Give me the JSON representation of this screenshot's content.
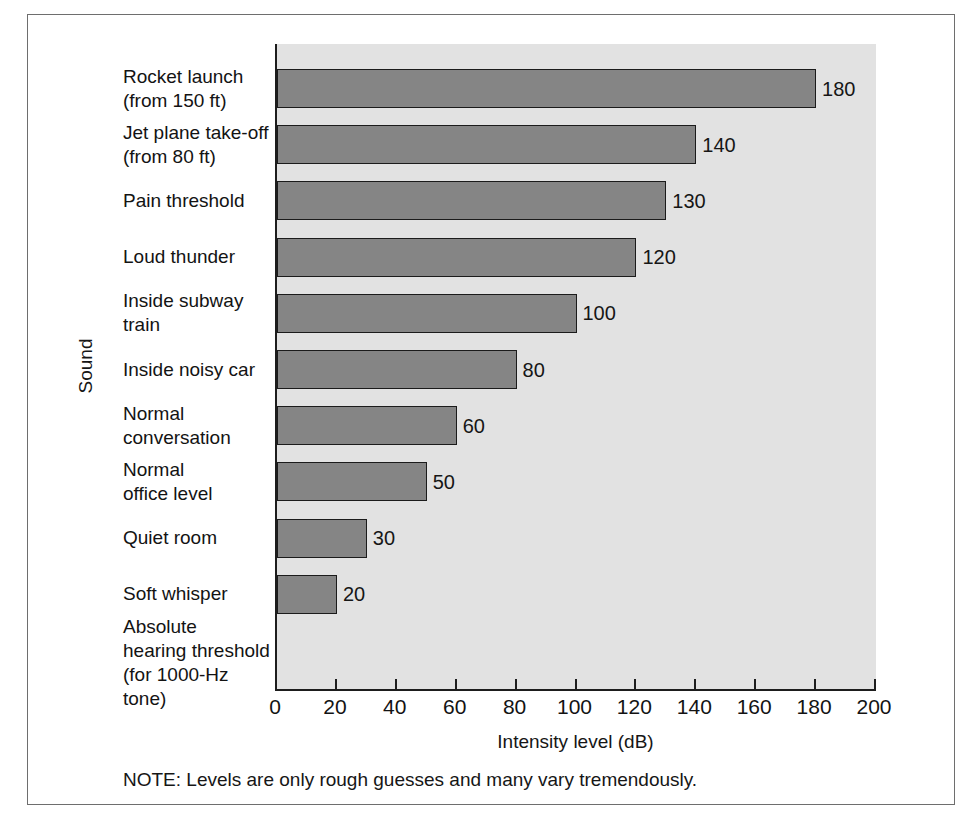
{
  "chart_data": {
    "type": "bar",
    "orientation": "horizontal",
    "title": "",
    "xlabel": "Intensity level (dB)",
    "ylabel": "Sound",
    "xlim": [
      0,
      200
    ],
    "xticks": [
      0,
      20,
      40,
      60,
      80,
      100,
      120,
      140,
      160,
      180,
      200
    ],
    "grid": false,
    "legend": null,
    "note": "NOTE:  Levels are only rough guesses and many vary tremendously.",
    "categories": [
      "Rocket launch\n(from 150 ft)",
      "Jet plane take-off\n(from 80 ft)",
      "Pain threshold",
      "Loud thunder",
      "Inside subway\ntrain",
      "Inside noisy car",
      "Normal\nconversation",
      "Normal\noffice level",
      "Quiet room",
      "Soft whisper",
      "Absolute\nhearing threshold\n(for 1000-Hz tone)"
    ],
    "values": [
      180,
      140,
      130,
      120,
      100,
      80,
      60,
      50,
      30,
      20,
      0
    ],
    "value_labels": [
      "180",
      "140",
      "130",
      "120",
      "100",
      "80",
      "60",
      "50",
      "30",
      "20",
      ""
    ],
    "colors": {
      "bar_fill": "#858585",
      "bar_stroke": "#1b1b1b",
      "plot_background": "#e2e2e2",
      "axis": "#1d1d1d",
      "frame": "#6e6e6e",
      "text": "#141414",
      "page_background": "#ffffff"
    }
  }
}
